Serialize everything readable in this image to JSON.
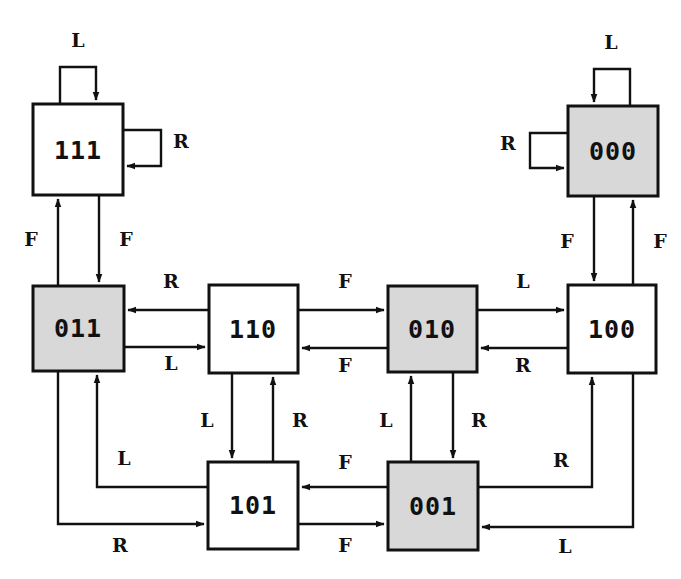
{
  "diagram": {
    "type": "state-machine",
    "canvas": {
      "width": 681,
      "height": 579
    },
    "colors": {
      "stroke": "#111111",
      "shaded_fill": "#d8d8d8",
      "plain_fill": "#ffffff",
      "background": "#ffffff"
    },
    "alphabet": [
      "L",
      "R",
      "F"
    ],
    "nodes": [
      {
        "id": "n111",
        "label": "111",
        "shaded": false,
        "x": 33,
        "y": 104,
        "w": 90,
        "h": 91
      },
      {
        "id": "n000",
        "label": "000",
        "shaded": true,
        "x": 568,
        "y": 106,
        "w": 90,
        "h": 90
      },
      {
        "id": "n011",
        "label": "011",
        "shaded": true,
        "x": 33,
        "y": 286,
        "w": 91,
        "h": 85
      },
      {
        "id": "n110",
        "label": "110",
        "shaded": false,
        "x": 209,
        "y": 285,
        "w": 89,
        "h": 88
      },
      {
        "id": "n010",
        "label": "010",
        "shaded": true,
        "x": 388,
        "y": 286,
        "w": 89,
        "h": 86
      },
      {
        "id": "n100",
        "label": "100",
        "shaded": false,
        "x": 568,
        "y": 285,
        "w": 88,
        "h": 88
      },
      {
        "id": "n101",
        "label": "101",
        "shaded": false,
        "x": 208,
        "y": 462,
        "w": 90,
        "h": 87
      },
      {
        "id": "n001",
        "label": "001",
        "shaded": true,
        "x": 388,
        "y": 462,
        "w": 90,
        "h": 88
      }
    ],
    "edges": [
      {
        "id": "e1",
        "from": "n111",
        "to": "n111",
        "label": "L",
        "label_x": 78,
        "label_y": 40,
        "kind": "self-loop-top"
      },
      {
        "id": "e2",
        "from": "n111",
        "to": "n111",
        "label": "R",
        "label_x": 181,
        "label_y": 141,
        "kind": "self-loop-right"
      },
      {
        "id": "e3",
        "from": "n000",
        "to": "n000",
        "label": "L",
        "label_x": 611,
        "label_y": 42,
        "kind": "self-loop-top"
      },
      {
        "id": "e4",
        "from": "n000",
        "to": "n000",
        "label": "R",
        "label_x": 508,
        "label_y": 143,
        "kind": "self-loop-left"
      },
      {
        "id": "e5",
        "from": "n011",
        "to": "n111",
        "label": "F",
        "label_x": 31,
        "label_y": 239,
        "kind": "vertical-up"
      },
      {
        "id": "e6",
        "from": "n111",
        "to": "n011",
        "label": "F",
        "label_x": 126,
        "label_y": 239,
        "kind": "vertical-down"
      },
      {
        "id": "e7",
        "from": "n000",
        "to": "n100",
        "label": "F",
        "label_x": 567,
        "label_y": 241,
        "kind": "vertical-down"
      },
      {
        "id": "e8",
        "from": "n100",
        "to": "n000",
        "label": "F",
        "label_x": 660,
        "label_y": 241,
        "kind": "vertical-up"
      },
      {
        "id": "e9",
        "from": "n110",
        "to": "n011",
        "label": "R",
        "label_x": 171,
        "label_y": 281,
        "kind": "horizontal-left"
      },
      {
        "id": "e10",
        "from": "n011",
        "to": "n110",
        "label": "L",
        "label_x": 171,
        "label_y": 363,
        "kind": "horizontal-right"
      },
      {
        "id": "e11",
        "from": "n110",
        "to": "n010",
        "label": "F",
        "label_x": 345,
        "label_y": 281,
        "kind": "horizontal-right"
      },
      {
        "id": "e12",
        "from": "n010",
        "to": "n110",
        "label": "F",
        "label_x": 345,
        "label_y": 365,
        "kind": "horizontal-left"
      },
      {
        "id": "e13",
        "from": "n010",
        "to": "n100",
        "label": "L",
        "label_x": 523,
        "label_y": 281,
        "kind": "horizontal-right"
      },
      {
        "id": "e14",
        "from": "n100",
        "to": "n010",
        "label": "R",
        "label_x": 523,
        "label_y": 365,
        "kind": "horizontal-left"
      },
      {
        "id": "e15",
        "from": "n110",
        "to": "n101",
        "label": "L",
        "label_x": 207,
        "label_y": 420,
        "kind": "vertical-down"
      },
      {
        "id": "e16",
        "from": "n101",
        "to": "n110",
        "label": "R",
        "label_x": 300,
        "label_y": 420,
        "kind": "vertical-up"
      },
      {
        "id": "e17",
        "from": "n001",
        "to": "n010",
        "label": "L",
        "label_x": 386,
        "label_y": 420,
        "kind": "vertical-up"
      },
      {
        "id": "e18",
        "from": "n010",
        "to": "n001",
        "label": "R",
        "label_x": 479,
        "label_y": 420,
        "kind": "vertical-down"
      },
      {
        "id": "e19",
        "from": "n001",
        "to": "n101",
        "label": "F",
        "label_x": 345,
        "label_y": 462,
        "kind": "horizontal-left"
      },
      {
        "id": "e20",
        "from": "n101",
        "to": "n001",
        "label": "F",
        "label_x": 345,
        "label_y": 545,
        "kind": "horizontal-right"
      },
      {
        "id": "e21",
        "from": "n101",
        "to": "n011",
        "label": "L",
        "label_x": 124,
        "label_y": 458,
        "kind": "route-up-left"
      },
      {
        "id": "e22",
        "from": "n011",
        "to": "n101",
        "label": "R",
        "label_x": 120,
        "label_y": 545,
        "kind": "route-down-right"
      },
      {
        "id": "e23",
        "from": "n001",
        "to": "n100",
        "label": "R",
        "label_x": 561,
        "label_y": 460,
        "kind": "route-up-right"
      },
      {
        "id": "e24",
        "from": "n100",
        "to": "n001",
        "label": "L",
        "label_x": 565,
        "label_y": 546,
        "kind": "route-down-left"
      }
    ]
  }
}
